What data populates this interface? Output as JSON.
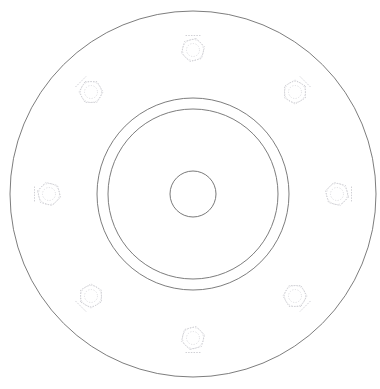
{
  "drawing": {
    "type": "engineering-drawing",
    "view_name": "flange-face-view",
    "background_color": "#ffffff",
    "canvas": {
      "width": 380,
      "height": 389
    },
    "center": {
      "x": 193,
      "y": 194
    },
    "line_colors": {
      "visible_edge": "#6e6e6e",
      "hidden_edge": "#c9c9cf",
      "background": "#ffffff"
    },
    "features": {
      "outer_rim": {
        "name": "outer-flange-circle",
        "radius": 183,
        "line_style": "visible"
      },
      "hub_outer": {
        "name": "hub-outer-circle",
        "radius": 96,
        "line_style": "visible"
      },
      "hub_inner": {
        "name": "hub-inner-circle",
        "radius": 85,
        "line_style": "visible"
      },
      "center_bore": {
        "name": "center-bore-circle",
        "radius": 23,
        "line_style": "visible"
      },
      "bolt_pattern": {
        "name": "bolt-hole-pattern",
        "count": 8,
        "bolt_circle_radius": 144,
        "start_angle_deg": -90,
        "angular_pitch_deg": 45,
        "line_style": "hidden",
        "hex_across_flats": 21,
        "hex_circumscribed_radius": 12,
        "washer_radius": 10.5,
        "bolt_shank_radius": 6.5,
        "holes": [
          {
            "index": 1,
            "angle_deg": -90,
            "cx": 193,
            "cy": 50,
            "label": "bolt-hole-1"
          },
          {
            "index": 2,
            "angle_deg": -45,
            "cx": 295,
            "cy": 92,
            "label": "bolt-hole-2"
          },
          {
            "index": 3,
            "angle_deg": 0,
            "cx": 337,
            "cy": 194,
            "label": "bolt-hole-3"
          },
          {
            "index": 4,
            "angle_deg": 45,
            "cx": 295,
            "cy": 296,
            "label": "bolt-hole-4"
          },
          {
            "index": 5,
            "angle_deg": 90,
            "cx": 193,
            "cy": 338,
            "label": "bolt-hole-5"
          },
          {
            "index": 6,
            "angle_deg": 135,
            "cx": 91,
            "cy": 296,
            "label": "bolt-hole-6"
          },
          {
            "index": 7,
            "angle_deg": 180,
            "cx": 49,
            "cy": 194,
            "label": "bolt-hole-7"
          },
          {
            "index": 8,
            "angle_deg": -135,
            "cx": 91,
            "cy": 92,
            "label": "bolt-hole-8"
          }
        ]
      }
    }
  },
  "chart_data": {
    "type": "scatter",
    "title": "",
    "xlabel": "",
    "ylabel": "",
    "grid": false,
    "legend": "none",
    "xlim": [
      0,
      380
    ],
    "ylim": [
      0,
      389
    ],
    "annotations": [],
    "series": [
      {
        "name": "bolt-hole-centers",
        "x": [
          193,
          295,
          337,
          295,
          193,
          91,
          49,
          91
        ],
        "y": [
          50,
          92,
          194,
          296,
          338,
          296,
          194,
          92
        ]
      }
    ],
    "circles": [
      {
        "name": "outer-flange-circle",
        "cx": 193,
        "cy": 194,
        "r": 183
      },
      {
        "name": "hub-outer-circle",
        "cx": 193,
        "cy": 194,
        "r": 96
      },
      {
        "name": "hub-inner-circle",
        "cx": 193,
        "cy": 194,
        "r": 85
      },
      {
        "name": "center-bore-circle",
        "cx": 193,
        "cy": 194,
        "r": 23
      }
    ]
  }
}
